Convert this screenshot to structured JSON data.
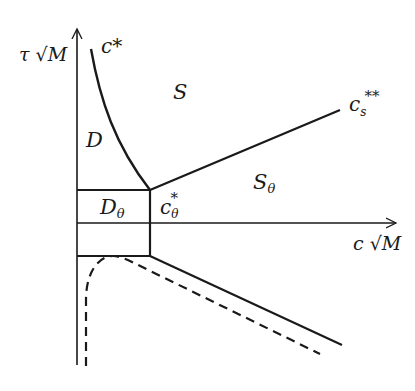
{
  "diagram": {
    "type": "phase-diagram",
    "axes": {
      "y_label": "τ √M",
      "x_label": "c √M"
    },
    "regions": [
      {
        "id": "D",
        "label": "D"
      },
      {
        "id": "S",
        "label": "S"
      },
      {
        "id": "D_theta",
        "label": "D",
        "subscript": "θ"
      },
      {
        "id": "S_theta",
        "label": "S",
        "subscript": "θ"
      }
    ],
    "curves": [
      {
        "id": "c_star",
        "label": "c*",
        "style": "solid"
      },
      {
        "id": "c_s_double_star",
        "label": "c",
        "subscript": "s",
        "superscript": "**",
        "style": "solid"
      },
      {
        "id": "c_theta_star",
        "label": "c",
        "subscript": "θ",
        "superscript": "*",
        "style": "solid"
      },
      {
        "id": "lower_boundary",
        "style": "solid"
      },
      {
        "id": "dashed_boundary",
        "style": "dashed"
      }
    ],
    "colors": {
      "line": "#1a1a1a",
      "background": "#ffffff"
    }
  }
}
